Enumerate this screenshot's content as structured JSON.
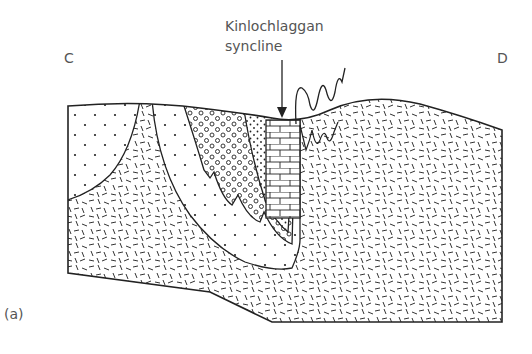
{
  "figure": {
    "panel_label": "(a)",
    "left_end_label": "C",
    "right_end_label": "D",
    "annotation": {
      "line1": "Kinlochlaggan",
      "line2": "syncline"
    }
  },
  "colors": {
    "line": "#1a1a1a",
    "text": "#555555",
    "background": "#ffffff"
  },
  "units": [
    {
      "name": "dotted-unit",
      "pattern": "sparse dots"
    },
    {
      "name": "dashed-basement",
      "pattern": "random dashes"
    },
    {
      "name": "circle-unit",
      "pattern": "small circles"
    },
    {
      "name": "fine-dot-unit",
      "pattern": "fine dots"
    },
    {
      "name": "limestone-unit",
      "pattern": "brick"
    }
  ]
}
